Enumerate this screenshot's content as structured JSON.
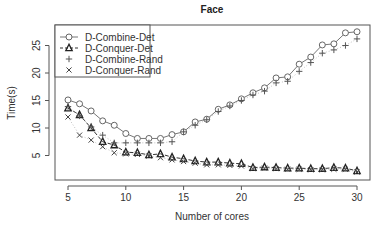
{
  "chart_data": {
    "type": "line",
    "title": "Face",
    "xlabel": "Number of cores",
    "ylabel": "Time(s)",
    "xlim": [
      4.4,
      30.7
    ],
    "ylim": [
      0.5,
      28.2
    ],
    "xticks": [
      5,
      10,
      15,
      20,
      25,
      30
    ],
    "yticks": [
      5,
      10,
      15,
      20,
      25
    ],
    "grid": false,
    "legend_position": "top-left",
    "x": [
      5,
      6,
      7,
      8,
      9,
      10,
      11,
      12,
      13,
      14,
      15,
      16,
      17,
      18,
      19,
      20,
      21,
      22,
      23,
      24,
      25,
      26,
      27,
      28,
      29,
      30
    ],
    "series": [
      {
        "name": "D-Combine-Det",
        "marker": "circle",
        "line": "solid",
        "values": [
          15.1,
          14.4,
          13.1,
          11.3,
          10.5,
          9.0,
          8.1,
          8.1,
          8.1,
          8.8,
          9.3,
          11.1,
          11.6,
          13.4,
          14.2,
          15.3,
          16.4,
          17.3,
          19.1,
          19.3,
          21.6,
          22.9,
          25.1,
          25.3,
          27.3,
          27.5
        ]
      },
      {
        "name": "D-Conquer-Det",
        "marker": "triangle",
        "line": "dashed",
        "values": [
          13.6,
          12.4,
          10.0,
          7.5,
          6.9,
          5.6,
          5.5,
          5.1,
          5.3,
          4.7,
          4.4,
          4.0,
          3.8,
          3.8,
          3.6,
          3.5,
          2.8,
          2.9,
          2.8,
          2.7,
          2.7,
          2.6,
          2.6,
          2.8,
          2.7,
          2.2
        ]
      },
      {
        "name": "D-Combine-Rand",
        "marker": "plus",
        "line": "none",
        "values": [
          13.9,
          12.2,
          10.2,
          8.7,
          7.3,
          7.3,
          7.3,
          7.3,
          7.3,
          7.5,
          9.3,
          10.5,
          11.5,
          13.0,
          14.0,
          15.0,
          16.0,
          16.7,
          18.2,
          18.5,
          20.3,
          21.9,
          23.6,
          24.2,
          25.0,
          26.2
        ]
      },
      {
        "name": "D-Conquer-Rand",
        "marker": "cross",
        "line": "none",
        "values": [
          12.0,
          8.7,
          7.8,
          6.6,
          5.5,
          5.3,
          5.2,
          4.9,
          4.6,
          4.2,
          3.9,
          3.6,
          3.3,
          3.3,
          3.2,
          3.1,
          2.6,
          2.7,
          2.6,
          2.5,
          2.5,
          2.4,
          2.4,
          2.5,
          2.5,
          2.0
        ]
      }
    ]
  }
}
